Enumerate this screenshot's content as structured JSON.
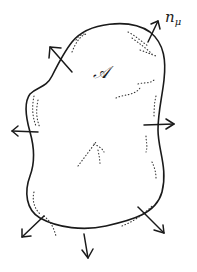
{
  "diagram": {
    "region_label": "𝒜",
    "normal_label": {
      "base": "n",
      "subscript": "μ"
    },
    "colors": {
      "stroke": "#1a1a1a",
      "background": "#ffffff"
    },
    "normal_arrows_count": 7
  }
}
